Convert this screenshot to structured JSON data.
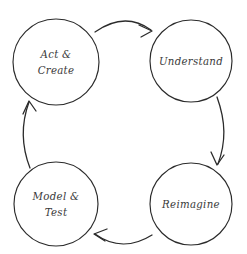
{
  "diagram": {
    "type": "cyclic-process",
    "direction": "clockwise",
    "background_color": "#ffffff",
    "stroke_color": "#2b2b2b",
    "text_color": "#3a3a3a",
    "nodes": [
      {
        "id": "act-create",
        "label_lines": [
          "Act &",
          "Create"
        ],
        "line1": "Act &",
        "line2": "Create",
        "position": "top-left",
        "cx": 56,
        "cy": 62,
        "r": 43
      },
      {
        "id": "understand",
        "label_lines": [
          "Understand"
        ],
        "line1": "Understand",
        "line2": "",
        "position": "top-right",
        "cx": 191,
        "cy": 61,
        "r": 41
      },
      {
        "id": "reimagine",
        "label_lines": [
          "Reimagine"
        ],
        "line1": "Reimagine",
        "line2": "",
        "position": "bottom-right",
        "cx": 191,
        "cy": 204,
        "r": 41
      },
      {
        "id": "model-test",
        "label_lines": [
          "Model &",
          "Test"
        ],
        "line1": "Model &",
        "line2": "Test",
        "position": "bottom-left",
        "cx": 56,
        "cy": 204,
        "r": 42
      }
    ],
    "edges": [
      {
        "id": "act-create-to-understand",
        "from": "act-create",
        "to": "understand",
        "side": "top",
        "arrow_direction": "right"
      },
      {
        "id": "understand-to-reimagine",
        "from": "understand",
        "to": "reimagine",
        "side": "right",
        "arrow_direction": "down"
      },
      {
        "id": "reimagine-to-model-test",
        "from": "reimagine",
        "to": "model-test",
        "side": "bottom",
        "arrow_direction": "left"
      },
      {
        "id": "model-test-to-act-create",
        "from": "model-test",
        "to": "act-create",
        "side": "left",
        "arrow_direction": "up"
      }
    ]
  }
}
